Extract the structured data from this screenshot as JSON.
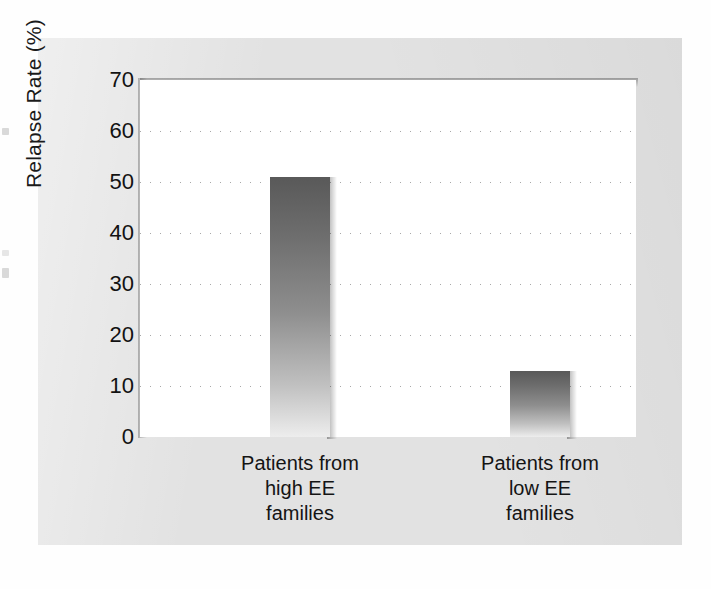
{
  "chart_data": {
    "type": "bar",
    "title": "",
    "xlabel": "",
    "ylabel": "Relapse Rate (%)",
    "categories": [
      "Patients from\nhigh EE\nfamilies",
      "Patients from\nlow EE\nfamilies"
    ],
    "values": [
      51,
      13
    ],
    "ylim": [
      0,
      70
    ],
    "yticks": [
      0,
      10,
      20,
      30,
      40,
      50,
      60,
      70
    ],
    "ytick_labels": [
      "0",
      "10",
      "20",
      "30",
      "40",
      "50",
      "60",
      "70"
    ],
    "gridlines": [
      10,
      20,
      30,
      40,
      50,
      60
    ],
    "grid": true,
    "legend": "none",
    "bar_style": "vertical-gradient-gray-with-drop-shadow",
    "colors": {
      "bar_top": "#595959",
      "bar_bottom": "#ededed",
      "panel_background": "#e2e2e2",
      "plot_background": "#ffffff",
      "gridline": "#a8a8a8",
      "text": "#121212"
    }
  },
  "axis": {
    "y_title": "Relapse Rate (%)",
    "ticks": [
      {
        "label": "70",
        "value": 70
      },
      {
        "label": "60",
        "value": 60
      },
      {
        "label": "50",
        "value": 50
      },
      {
        "label": "40",
        "value": 40
      },
      {
        "label": "30",
        "value": 30
      },
      {
        "label": "20",
        "value": 20
      },
      {
        "label": "10",
        "value": 10
      },
      {
        "label": "0",
        "value": 0
      }
    ]
  },
  "bars": [
    {
      "category": "Patients from\nhigh EE\nfamilies",
      "value": 51
    },
    {
      "category": "Patients from\nlow EE\nfamilies",
      "value": 13
    }
  ]
}
